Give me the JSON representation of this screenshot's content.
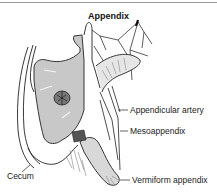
{
  "figure": {
    "title": "Appendix",
    "labels": {
      "appendicular_artery": "Appendicular artery",
      "mesoappendix": "Mesoappendix",
      "cecum": "Cecum",
      "vermiform_appendix": "Vermiform appendix"
    },
    "colors": {
      "cecum_fill": "#c8c8c8",
      "line": "#222222",
      "top_rule": "#9a9a9a"
    }
  }
}
